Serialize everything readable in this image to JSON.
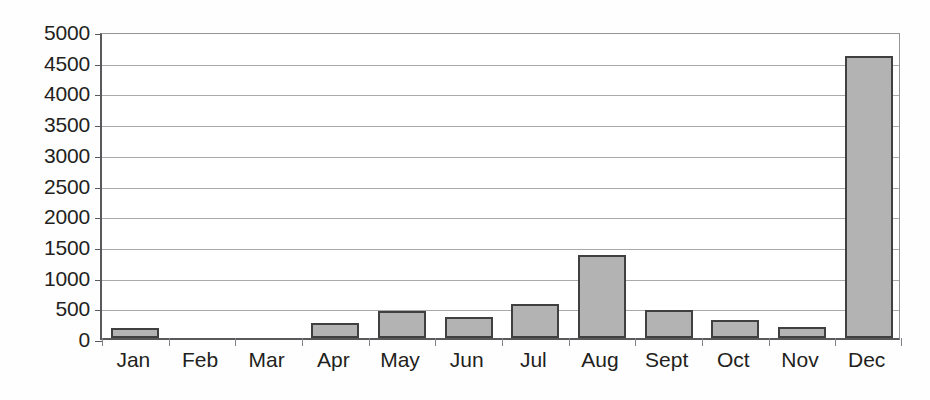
{
  "chart_data": {
    "type": "bar",
    "title": "",
    "subtitle": "",
    "xlabel": "",
    "ylabel": "",
    "categories": [
      "Jan",
      "Feb",
      "Mar",
      "Apr",
      "May",
      "Jun",
      "Jul",
      "Aug",
      "Sept",
      "Oct",
      "Nov",
      "Dec"
    ],
    "values": [
      170,
      0,
      0,
      240,
      440,
      340,
      560,
      1350,
      450,
      290,
      180,
      4600
    ],
    "series": [
      {
        "name": "",
        "values": [
          170,
          0,
          0,
          240,
          440,
          340,
          560,
          1350,
          450,
          290,
          180,
          4600
        ]
      }
    ],
    "ylim": [
      0,
      5000
    ],
    "ytick_step": 500,
    "ytick_labels": [
      "5000",
      "4500",
      "4000",
      "3500",
      "3000",
      "2500",
      "2000",
      "1500",
      "1000",
      "500",
      "0"
    ],
    "ytick_values": [
      5000,
      4500,
      4000,
      3500,
      3000,
      2500,
      2000,
      1500,
      1000,
      500,
      0
    ],
    "grid": true,
    "grid_axis": "y",
    "legend": false,
    "legend_position": "none",
    "bar_fill_color": "#b3b3b3",
    "bar_border_color": "#404041",
    "gridline_color": "#a7a9ac",
    "axis_color": "#58595b",
    "text_color": "#231f20",
    "background_color": "#ffffff"
  }
}
